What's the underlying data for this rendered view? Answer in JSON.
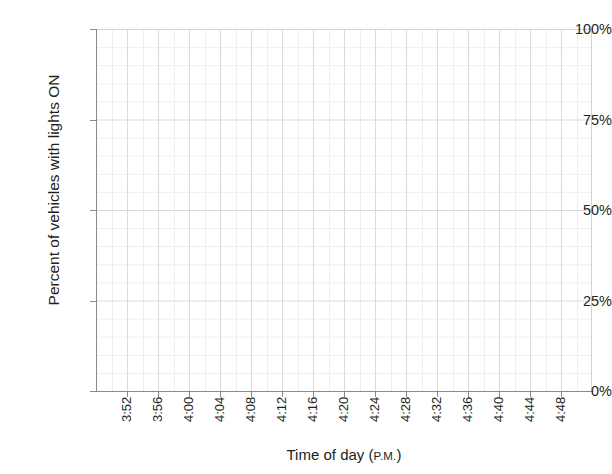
{
  "chart_data": {
    "type": "line",
    "title": "",
    "title_remnant": "",
    "xlabel": "Time of day",
    "xlabel_suffix": "P.M.",
    "xlabel_full": "Time of day (P.M.)",
    "ylabel": "Percent of vehicles with lights ON",
    "ylim": [
      0,
      100
    ],
    "ytick_labels": [
      "0%",
      "25%",
      "50%",
      "75%",
      "100%"
    ],
    "ytick_values": [
      0,
      25,
      50,
      75,
      100
    ],
    "y_minor_step": 5,
    "x_categories": [
      "3:52",
      "3:56",
      "4:00",
      "4:04",
      "4:08",
      "4:12",
      "4:16",
      "4:20",
      "4:24",
      "4:28",
      "4:32",
      "4:36",
      "4:40",
      "4:44",
      "4:48"
    ],
    "x_tick_interval_minutes": 4,
    "grid": true,
    "grid_minor": true,
    "legend": "none",
    "series": [],
    "values": [],
    "note": "Empty plot grid - no data series drawn in plot area",
    "colors": {
      "grid_major": "#d9d9dd",
      "grid_minor": "#eeeef1",
      "axis": "#8a8a8e",
      "text": "#231f20",
      "background": "#ffffff"
    }
  }
}
